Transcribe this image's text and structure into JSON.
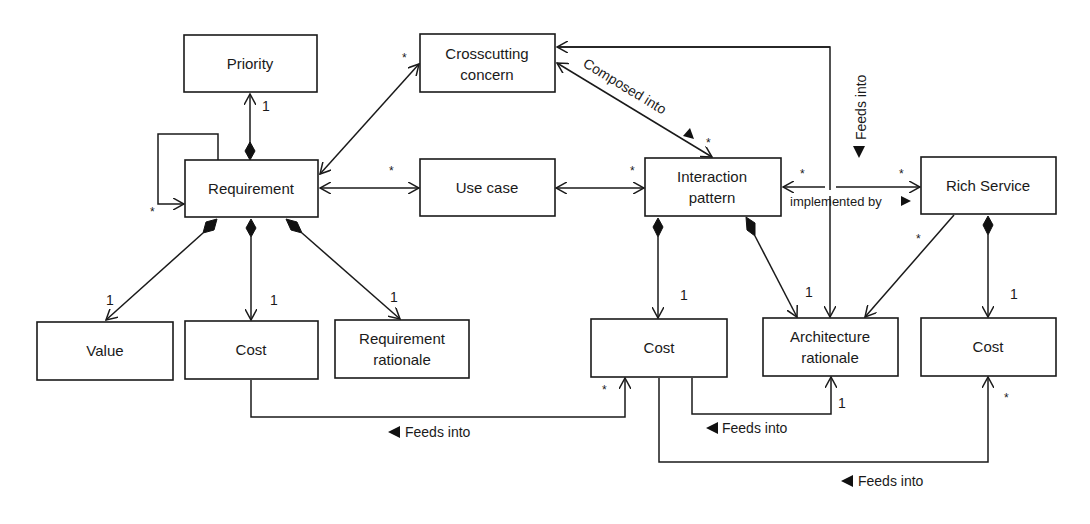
{
  "diagram": {
    "type": "UML class diagram",
    "classes": {
      "priority": "Priority",
      "requirement": "Requirement",
      "crosscutting_1": "Crosscutting",
      "crosscutting_2": "concern",
      "use_case": "Use case",
      "interaction_1": "Interaction",
      "interaction_2": "pattern",
      "rich_service": "Rich Service",
      "value": "Value",
      "req_cost": "Cost",
      "req_rationale_1": "Requirement",
      "req_rationale_2": "rationale",
      "ip_cost": "Cost",
      "arch_rationale_1": "Architecture",
      "arch_rationale_2": "rationale",
      "rs_cost": "Cost"
    },
    "associations": {
      "composed_into": "Composed into",
      "implemented_by": "implemented by",
      "feeds_into_vertical": "Feeds into",
      "feeds_into_req_cost": "Feeds into",
      "feeds_into_ip_cost": "Feeds into",
      "feeds_into_rs_cost": "Feeds into"
    },
    "multiplicities": {
      "one": "1",
      "many": "*"
    }
  }
}
